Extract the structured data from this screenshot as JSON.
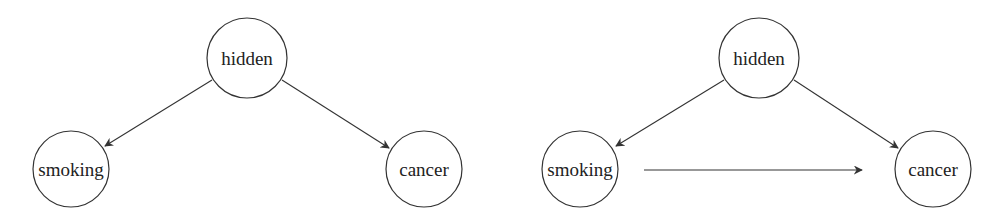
{
  "diagrams": [
    {
      "name": "confounder-model",
      "nodes": [
        {
          "id": "hidden",
          "label": "hidden",
          "cx": 247,
          "cy": 58,
          "r": 40
        },
        {
          "id": "smoking",
          "label": "smoking",
          "cx": 71,
          "cy": 169,
          "r": 38
        },
        {
          "id": "cancer",
          "label": "cancer",
          "cx": 424,
          "cy": 169,
          "r": 38
        }
      ],
      "edges": [
        {
          "from": "hidden",
          "to": "smoking",
          "x1": 212,
          "y1": 80,
          "x2": 105,
          "y2": 146
        },
        {
          "from": "hidden",
          "to": "cancer",
          "x1": 282,
          "y1": 80,
          "x2": 389,
          "y2": 148
        }
      ]
    },
    {
      "name": "confounder-plus-causal-model",
      "nodes": [
        {
          "id": "hidden",
          "label": "hidden",
          "cx": 759,
          "cy": 58,
          "r": 40
        },
        {
          "id": "smoking",
          "label": "smoking",
          "cx": 580,
          "cy": 169,
          "r": 38
        },
        {
          "id": "cancer",
          "label": "cancer",
          "cx": 933,
          "cy": 169,
          "r": 38
        }
      ],
      "edges": [
        {
          "from": "hidden",
          "to": "smoking",
          "x1": 724,
          "y1": 80,
          "x2": 616,
          "y2": 146
        },
        {
          "from": "hidden",
          "to": "cancer",
          "x1": 794,
          "y1": 80,
          "x2": 898,
          "y2": 148
        },
        {
          "from": "smoking",
          "to": "cancer",
          "x1": 644,
          "y1": 170,
          "x2": 862,
          "y2": 170
        }
      ]
    }
  ],
  "colors": {
    "stroke": "#333333",
    "text": "#222222",
    "background": "#ffffff"
  }
}
